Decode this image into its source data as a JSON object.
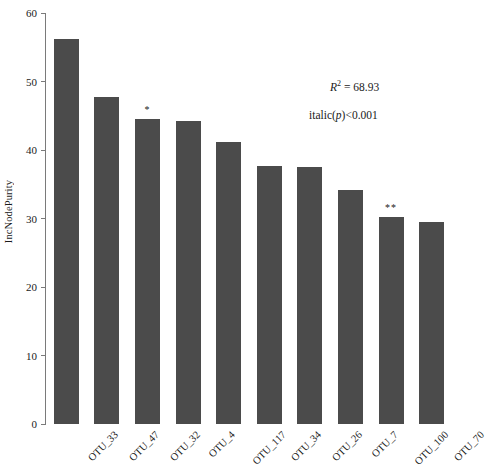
{
  "axes": {
    "y_title": "IncNodePurity",
    "y_ticks": [
      "60",
      "50",
      "40",
      "30",
      "20",
      "10",
      "0"
    ],
    "y_min": 0,
    "y_max": 60
  },
  "annotations": {
    "r2_prefix": "R",
    "r2_sup": "2",
    "r2_body": " = 68.93",
    "r2_full": "R2 = 68.93",
    "p_text": "italic(p)<0.001",
    "p_lead": "italic(",
    "p_var": "p",
    "p_tail": ")<0.001"
  },
  "significance": {
    "one_star": "*",
    "two_star": "**"
  },
  "colors": {
    "bar": "#4b4b4b",
    "axis": "#7a7a7a",
    "text": "#1a1a1a",
    "background": "#ffffff"
  },
  "chart_data": {
    "type": "bar",
    "title": "",
    "xlabel": "",
    "ylabel": "IncNodePurity",
    "ylim": [
      0,
      60
    ],
    "yticks": [
      0,
      10,
      20,
      30,
      40,
      50,
      60
    ],
    "grid": false,
    "legend": null,
    "categories": [
      "OTU_33",
      "OTU_47",
      "OTU_32",
      "OTU_4",
      "OTU_117",
      "OTU_34",
      "OTU_26",
      "OTU_7",
      "OTU_100",
      "OTU_70"
    ],
    "values": [
      56.2,
      47.8,
      44.6,
      44.2,
      41.2,
      37.7,
      37.5,
      34.2,
      30.2,
      29.5
    ],
    "point_labels": [
      "",
      "",
      "*",
      "",
      "",
      "",
      "",
      "",
      "**",
      ""
    ],
    "annotations": [
      "R2 = 68.93",
      "italic(p)<0.001"
    ]
  }
}
